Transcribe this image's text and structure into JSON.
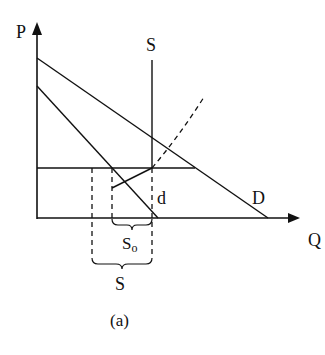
{
  "diagram": {
    "caption": "(a)",
    "axes": {
      "y_label": "P",
      "x_label": "Q"
    },
    "curves": {
      "supply_label": "S",
      "demand_label": "D",
      "d_label": "d"
    },
    "braces": {
      "inner_label": "S",
      "inner_subscript": "o",
      "outer_label": "S"
    },
    "colors": {
      "line": "#111111",
      "background": "#ffffff"
    }
  }
}
